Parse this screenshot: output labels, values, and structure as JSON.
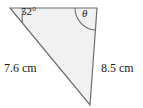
{
  "diagram": {
    "type": "triangle",
    "fill_color": "#f1f1f1",
    "stroke_color": "#6e6e6e",
    "text_color": "#1a1a1a",
    "vertices": {
      "top_left": {
        "x": 10,
        "y": 8
      },
      "top_right": {
        "x": 97,
        "y": 8
      },
      "bottom": {
        "x": 90,
        "y": 105
      }
    },
    "angles": [
      {
        "id": "angle-52",
        "label": "52°",
        "value": 52,
        "unit": "degrees",
        "at_vertex": "top_left",
        "arc": "M 22.5 22.2 A 16 16 0 0 1 26 8"
      },
      {
        "id": "angle-theta",
        "label": "θ",
        "value": null,
        "unit": "degrees",
        "at_vertex": "top_right",
        "arc": "M 75 8 A 22 22 0 0 0 95.4 30"
      }
    ],
    "sides": [
      {
        "id": "side-left",
        "label": "7.6 cm",
        "value": 7.6,
        "unit": "cm",
        "from": "top_left",
        "to": "bottom"
      },
      {
        "id": "side-right",
        "label": "8.5 cm",
        "value": 8.5,
        "unit": "cm",
        "from": "top_right",
        "to": "bottom"
      }
    ]
  }
}
